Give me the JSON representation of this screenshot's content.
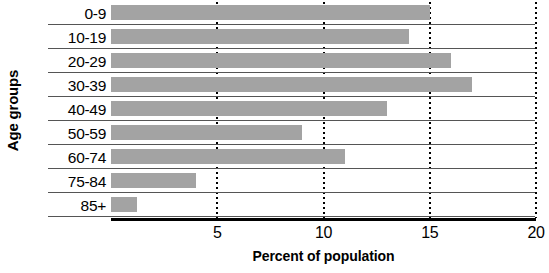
{
  "chart_data": {
    "type": "bar",
    "orientation": "horizontal",
    "title": "",
    "xlabel": "Percent of population",
    "ylabel": "Age groups",
    "categories": [
      "0-9",
      "10-19",
      "20-29",
      "30-39",
      "40-49",
      "50-59",
      "60-74",
      "75-84",
      "85+"
    ],
    "values": [
      15,
      14,
      16,
      17,
      13,
      9,
      11,
      4,
      1.2
    ],
    "xlim": [
      0,
      20
    ],
    "xticks": [
      5,
      10,
      15,
      20
    ],
    "xtick_labels": [
      "5",
      "10",
      "15",
      "20"
    ],
    "grid": "vertical-dotted",
    "legend": "none",
    "bar_color": "#a3a3a3",
    "axis_color": "#000000",
    "separator_color": "#555555"
  }
}
